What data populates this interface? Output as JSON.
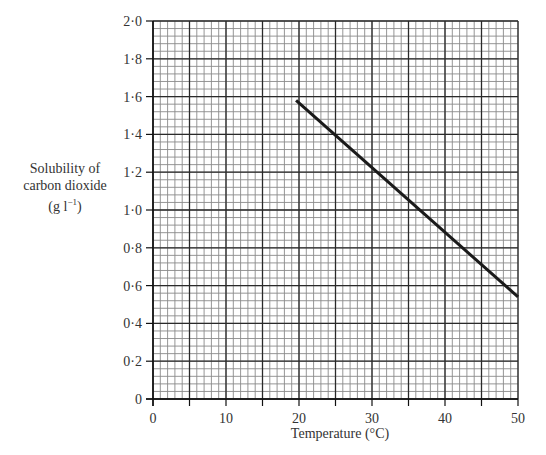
{
  "chart_data": {
    "type": "line",
    "title": "",
    "xlabel": "Temperature (°C)",
    "ylabel_lines": [
      "Solubility of",
      "carbon dioxide",
      "(g l",
      "−1",
      ")"
    ],
    "ylabel": "Solubility of carbon dioxide (g l−1)",
    "xlim": [
      0,
      50
    ],
    "ylim": [
      0,
      2.0
    ],
    "x_ticks": [
      0,
      10,
      20,
      30,
      40,
      50
    ],
    "x_tick_labels": [
      "0",
      "10",
      "20",
      "30",
      "40",
      "50"
    ],
    "y_ticks": [
      0,
      0.2,
      0.4,
      0.6,
      0.8,
      1.0,
      1.2,
      1.4,
      1.6,
      1.8,
      2.0
    ],
    "y_tick_labels": [
      "0",
      "0·2",
      "0·4",
      "0·6",
      "0·8",
      "1·0",
      "1·2",
      "1·4",
      "1·6",
      "1·8",
      "2·0"
    ],
    "grid": {
      "on": true,
      "x_major": 5,
      "x_minor": 1,
      "y_major": 0.2,
      "y_minor": 0.04
    },
    "legend": null,
    "series": [
      {
        "name": "Solubility of carbon dioxide",
        "x": [
          19.6,
          50
        ],
        "y": [
          1.58,
          0.54
        ],
        "color": "#1a1a1a"
      }
    ]
  },
  "labels": {
    "y_line1": "Solubility of",
    "y_line2": "carbon dioxide",
    "y_unit_pre": "(g l",
    "y_unit_sup": "−1",
    "y_unit_post": ")",
    "x_axis": "Temperature (°C)"
  }
}
